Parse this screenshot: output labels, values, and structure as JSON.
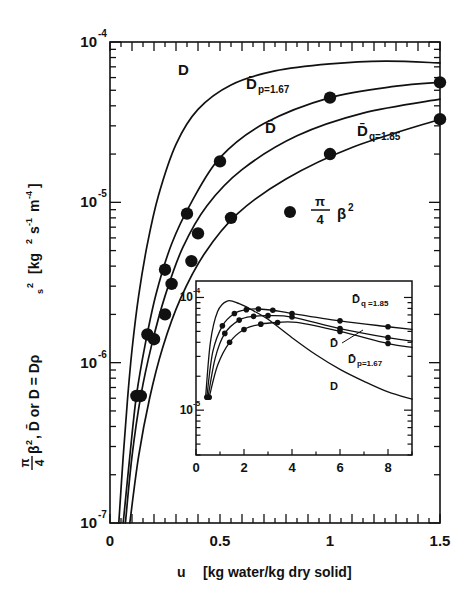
{
  "figure": {
    "kind": "semilog-scatter-line-plot-with-inset"
  },
  "main": {
    "xlabel_symbol": "u",
    "xlabel_units": "[kg water/kg dry solid]",
    "ylabel_full": "π/4 β², D̄ or D = Dρs²  [kg² s⁻¹ m⁻⁴]",
    "ylabel_p1": "π",
    "ylabel_p2": "4",
    "ylabel_p3": "β",
    "ylabel_p4": "2",
    "ylabel_p5": ", D̄ or  D = Dρ",
    "ylabel_p6": "s",
    "ylabel_p7": "2",
    "ylabel_p8": "[kg",
    "ylabel_p9": "2",
    "ylabel_p10": "s",
    "ylabel_p11": "-1",
    "ylabel_p12": "m",
    "ylabel_p13": "-4",
    "ylabel_p14": "]",
    "xticks": [
      "0",
      "0.5",
      "1",
      "1.5"
    ],
    "xtick_values": [
      0,
      0.5,
      1,
      1.5
    ],
    "yticks": [
      "10",
      "10",
      "10",
      "10"
    ],
    "ytick_exponents": [
      "-4",
      "-5",
      "-6",
      "-7"
    ],
    "ytick_values": [
      0.0001,
      1e-05,
      1e-06,
      1e-07
    ],
    "legend_marker": "filled-circle",
    "legend_p1": "π",
    "legend_p2": "4",
    "legend_p3": "β",
    "legend_p4": "2",
    "curve_labels": {
      "D": "D",
      "Dp": "D̄",
      "Dp_sub": "p=1.67",
      "Dbar": "D̄",
      "Dq": "D̄",
      "Dq_sub": "q=1.85"
    }
  },
  "inset": {
    "xticks": [
      "0",
      "2",
      "4",
      "6",
      "8"
    ],
    "xtick_values": [
      0,
      2,
      4,
      6,
      8
    ],
    "yticks": [
      "10",
      "10"
    ],
    "ytick_exponents": [
      "-4",
      "-5"
    ],
    "ytick_values": [
      0.0001,
      1e-05
    ],
    "curve_labels": {
      "Dq": "D̄",
      "Dq_sub": "q =1.85",
      "Dbar": "D̄",
      "Dp": "D̄",
      "Dp_sub": "p=1.67",
      "D": "D"
    }
  },
  "chart_data": {
    "type": "line",
    "title": "",
    "xlabel": "u  [kg water/kg dry solid]",
    "ylabel": "π/4 β², D̄ or D = Dρs²  [kg² s⁻¹ m⁻⁴]",
    "xlim": [
      0,
      1.5
    ],
    "ylim": [
      1e-07,
      0.0001
    ],
    "yscale": "log",
    "grid": false,
    "legend_position": "inside-right",
    "legend": [
      "π/4 β² (data points)"
    ],
    "series": [
      {
        "name": "D",
        "x": [
          0.04,
          0.06,
          0.08,
          0.1,
          0.13,
          0.17,
          0.22,
          0.3,
          0.4,
          0.55,
          0.75,
          1.0,
          1.25,
          1.5
        ],
        "y": [
          1e-07,
          2.6e-07,
          6e-07,
          1.2e-06,
          2.6e-06,
          5.5e-06,
          1.1e-05,
          2.3e-05,
          3.8e-05,
          5.4e-05,
          6.6e-05,
          7.3e-05,
          7.6e-05,
          7.4e-05
        ],
        "markers": false
      },
      {
        "name": "D̄_p=1.67",
        "x": [
          0.06,
          0.09,
          0.12,
          0.16,
          0.21,
          0.28,
          0.37,
          0.5,
          0.7,
          1.0,
          1.3,
          1.5
        ],
        "y": [
          1e-07,
          2.6e-07,
          6.2e-07,
          1.3e-06,
          2.7e-06,
          5.5e-06,
          1e-05,
          1.9e-05,
          3.1e-05,
          4.5e-05,
          5.3e-05,
          5.6e-05
        ],
        "markers": true,
        "marker_x": [
          0.12,
          0.17,
          0.25,
          0.35,
          0.5,
          1.0,
          1.5
        ],
        "marker_y": [
          6.2e-07,
          1.5e-06,
          3.8e-06,
          8.5e-06,
          1.8e-05,
          4.5e-05,
          5.6e-05
        ]
      },
      {
        "name": "D̄",
        "x": [
          0.07,
          0.1,
          0.14,
          0.19,
          0.25,
          0.33,
          0.44,
          0.6,
          0.85,
          1.15,
          1.5
        ],
        "y": [
          1e-07,
          2.6e-07,
          6.2e-07,
          1.3e-06,
          2.6e-06,
          5.2e-06,
          9.5e-06,
          1.6e-05,
          2.6e-05,
          3.6e-05,
          4.4e-05
        ],
        "markers": true,
        "marker_x": [
          0.14,
          0.2,
          0.28,
          0.4
        ],
        "marker_y": [
          6.2e-07,
          1.4e-06,
          3.1e-06,
          6.4e-06
        ]
      },
      {
        "name": "D̄_q=1.85",
        "x": [
          0.09,
          0.13,
          0.18,
          0.24,
          0.32,
          0.43,
          0.58,
          0.8,
          1.1,
          1.5
        ],
        "y": [
          1e-07,
          2.6e-07,
          6e-07,
          1.25e-06,
          2.5e-06,
          4.8e-06,
          8.5e-06,
          1.4e-05,
          2.2e-05,
          3.3e-05
        ],
        "markers": true,
        "marker_x": [
          0.25,
          0.37,
          0.55,
          1.0,
          1.5
        ],
        "marker_y": [
          2e-06,
          4.3e-06,
          8e-06,
          2e-05,
          3.3e-05
        ]
      }
    ],
    "inset": {
      "type": "line",
      "xlim": [
        0,
        9
      ],
      "ylim": [
        4e-06,
        0.00014
      ],
      "yscale": "log",
      "xlabel": "",
      "ylabel": "",
      "grid": false,
      "series": [
        {
          "name": "D",
          "x": [
            0.4,
            0.6,
            0.9,
            1.3,
            1.8,
            2.4,
            3.0,
            4.0,
            5.0,
            6.0,
            7.0,
            8.0,
            9.0
          ],
          "y": [
            1.3e-05,
            4e-05,
            7.5e-05,
            9.3e-05,
            8.8e-05,
            7.6e-05,
            6.4e-05,
            4.4e-05,
            3.1e-05,
            2.3e-05,
            1.8e-05,
            1.45e-05,
            1.25e-05
          ],
          "markers": false
        },
        {
          "name": "D̄_q=1.85",
          "x": [
            0.45,
            0.7,
            1.1,
            1.6,
            2.1,
            2.6,
            3.2,
            4.0,
            6.0,
            8.0,
            9.0
          ],
          "y": [
            1.3e-05,
            3.3e-05,
            5.6e-05,
            7.2e-05,
            7.8e-05,
            7.9e-05,
            7.7e-05,
            7.2e-05,
            6.2e-05,
            5.5e-05,
            5.2e-05
          ],
          "markers": true,
          "marker_x": [
            0.45,
            1.1,
            1.6,
            2.1,
            2.6,
            3.2,
            4.0,
            6.0,
            8.0
          ],
          "marker_y": [
            1.3e-05,
            5.6e-05,
            7.2e-05,
            7.8e-05,
            7.9e-05,
            7.7e-05,
            7.2e-05,
            6.2e-05,
            5.5e-05
          ]
        },
        {
          "name": "D̄",
          "x": [
            0.5,
            0.8,
            1.2,
            1.8,
            2.4,
            3.0,
            4.0,
            6.0,
            8.0,
            9.0
          ],
          "y": [
            1.3e-05,
            2.9e-05,
            4.8e-05,
            6.3e-05,
            6.8e-05,
            6.9e-05,
            6.7e-05,
            5.3e-05,
            4.4e-05,
            4.1e-05
          ],
          "markers": true,
          "marker_x": [
            0.5,
            1.2,
            1.8,
            2.4,
            3.0,
            4.0,
            6.0,
            8.0
          ],
          "marker_y": [
            1.3e-05,
            4.8e-05,
            6.3e-05,
            6.8e-05,
            6.9e-05,
            6.7e-05,
            5.3e-05,
            4.4e-05
          ]
        },
        {
          "name": "D̄_p=1.67",
          "x": [
            0.55,
            0.9,
            1.4,
            2.0,
            2.7,
            3.4,
            4.2,
            6.0,
            8.0,
            9.0
          ],
          "y": [
            1.3e-05,
            2.5e-05,
            4e-05,
            5.2e-05,
            5.8e-05,
            6e-05,
            6e-05,
            5e-05,
            3.9e-05,
            3.6e-05
          ],
          "markers": true,
          "marker_x": [
            0.55,
            1.4,
            2.0,
            2.7,
            3.4,
            6.0,
            8.0
          ],
          "marker_y": [
            1.3e-05,
            4e-05,
            5.2e-05,
            5.8e-05,
            6e-05,
            5e-05,
            3.9e-05
          ]
        }
      ]
    }
  }
}
